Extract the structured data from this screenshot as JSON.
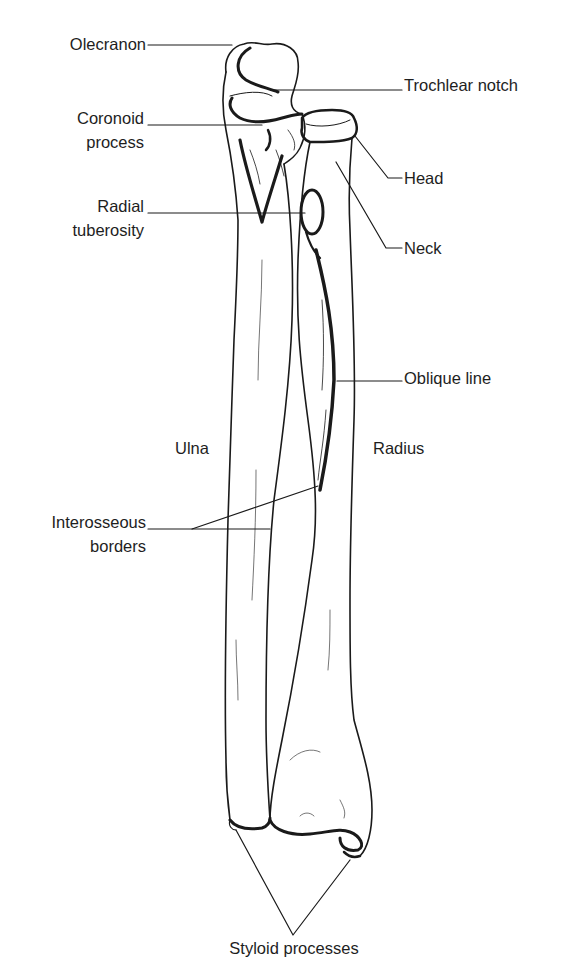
{
  "diagram": {
    "colors": {
      "ink": "#1a1a1a",
      "background": "#ffffff"
    },
    "labels": {
      "olecranon": "Olecranon",
      "coronoid_1": "Coronoid",
      "coronoid_2": "process",
      "radial_tuberosity_1": "Radial",
      "radial_tuberosity_2": "tuberosity",
      "trochlear_notch": "Trochlear notch",
      "head": "Head",
      "neck": "Neck",
      "oblique_line": "Oblique line",
      "ulna": "Ulna",
      "radius": "Radius",
      "interosseous_1": "Interosseous",
      "interosseous_2": "borders",
      "styloid_processes": "Styloid processes"
    }
  }
}
